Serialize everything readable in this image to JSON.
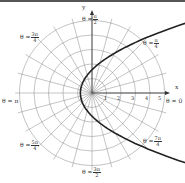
{
  "diagram": {
    "type": "polar-graph",
    "curve": "parabola r = 1/(1 - cos θ)",
    "axis_labels": {
      "x": "x",
      "y": "y"
    },
    "radial_ticks": [
      "1",
      "2",
      "3",
      "4",
      "5"
    ],
    "angle_labels": [
      {
        "id": "pi_over_2",
        "prefix": "θ =",
        "num": "π",
        "den": "2"
      },
      {
        "id": "3pi_over_4",
        "prefix": "θ =",
        "num": "3π",
        "den": "4"
      },
      {
        "id": "pi_over_4",
        "prefix": "θ =",
        "num": "π",
        "den": "4"
      },
      {
        "id": "pi",
        "prefix": "θ = π",
        "num": "",
        "den": ""
      },
      {
        "id": "zero",
        "prefix": "θ = 0",
        "num": "",
        "den": ""
      },
      {
        "id": "5pi_over_4",
        "prefix": "θ =",
        "num": "5π",
        "den": "4"
      },
      {
        "id": "7pi_over_4",
        "prefix": "θ =",
        "num": "7π",
        "den": "4"
      },
      {
        "id": "3pi_over_2",
        "prefix": "θ =",
        "num": "3π",
        "den": "2"
      }
    ]
  }
}
